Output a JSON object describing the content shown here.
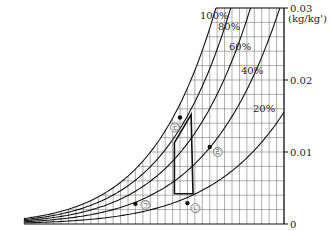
{
  "chart_data": {
    "type": "line",
    "title": "",
    "chart_kind": "psychrometric chart",
    "xlabel": "(℃)",
    "ylabel": "(kg/kg')",
    "x_ticks": [
      -20,
      -10,
      0,
      10,
      20,
      30,
      40,
      50
    ],
    "x_tick_labels": [
      "-20",
      "-10",
      "0",
      "10",
      "20",
      "30",
      "40",
      "50"
    ],
    "y_ticks": [
      0,
      0.01,
      0.02,
      0.03
    ],
    "y_tick_labels": [
      "0",
      "0.01",
      "0.02",
      "0.03"
    ],
    "xlim": [
      -20,
      50
    ],
    "ylim": [
      0,
      0.03
    ],
    "grid": true,
    "relative_humidity_curves": [
      {
        "label": "100%",
        "rh": 1.0
      },
      {
        "label": "80%",
        "rh": 0.8
      },
      {
        "label": "60%",
        "rh": 0.6
      },
      {
        "label": "40%",
        "rh": 0.4
      },
      {
        "label": "20%",
        "rh": 0.2
      }
    ],
    "points": [
      {
        "label": "㉠",
        "temp_c": 10,
        "humidity": 0.0028
      },
      {
        "label": "㉡",
        "temp_c": 24,
        "humidity": 0.0029
      },
      {
        "label": "㉢",
        "temp_c": 22,
        "humidity": 0.0148
      },
      {
        "label": "㉣",
        "temp_c": 30,
        "humidity": 0.0107
      }
    ],
    "region": {
      "description": "closed quadrilateral region",
      "vertices": [
        [
          20.5,
          0.0042
        ],
        [
          20.5,
          0.0113
        ],
        [
          25,
          0.0152
        ],
        [
          25.5,
          0.0042
        ]
      ]
    }
  }
}
